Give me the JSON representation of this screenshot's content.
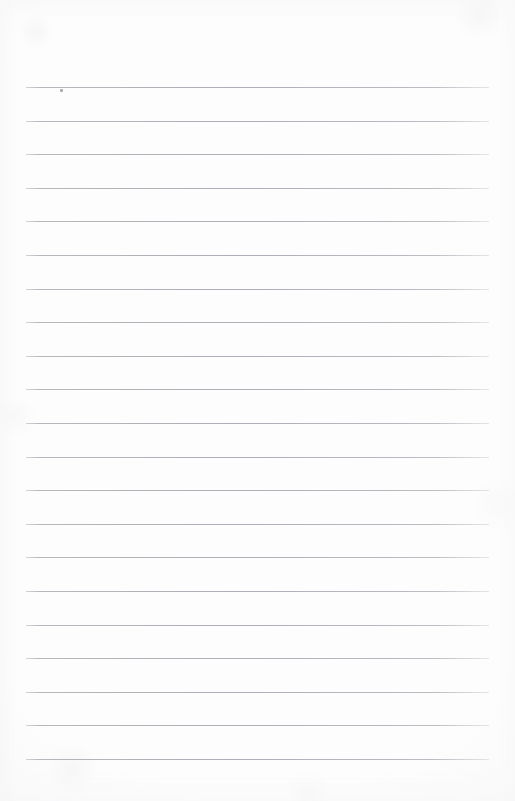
{
  "document": {
    "kind": "blank-lined-notebook-page",
    "title": "Blank Lined Page",
    "page_width": 515,
    "page_height": 801,
    "background_color": "#fdfdfd",
    "text_content": "",
    "handwriting": "",
    "headings": [],
    "body_lines": []
  },
  "ruling": {
    "line_count": 21,
    "line_color": "#b0b4b9",
    "line_thickness_px": 1,
    "first_line_y": 87,
    "line_spacing_px": 33.6,
    "left_margin_x": 26,
    "right_margin_x": 489,
    "line_length_px": 463,
    "lines_y": [
      87,
      120.6,
      154.2,
      187.8,
      221.4,
      255,
      288.6,
      322.2,
      355.8,
      389.4,
      423,
      456.6,
      490.2,
      523.8,
      557.4,
      591,
      624.6,
      658.2,
      691.8,
      725.4,
      759
    ],
    "line_labels": [
      "line-1",
      "line-2",
      "line-3",
      "line-4",
      "line-5",
      "line-6",
      "line-7",
      "line-8",
      "line-9",
      "line-10",
      "line-11",
      "line-12",
      "line-13",
      "line-14",
      "line-15",
      "line-16",
      "line-17",
      "line-18",
      "line-19",
      "line-20",
      "line-21"
    ]
  },
  "marks": [
    {
      "name": "ink-speck",
      "x": 60,
      "y": 89,
      "color": "#9a9ea3",
      "description": "small dark speck on the first ruled line"
    }
  ]
}
